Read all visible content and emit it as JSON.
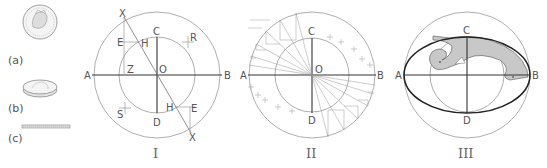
{
  "coins": {
    "a": {
      "label": "(a)",
      "description": "coin face-on"
    },
    "b": {
      "label": "(b)",
      "description": "coin tilted"
    },
    "c": {
      "label": "(c)",
      "description": "coin edge-on"
    }
  },
  "diagram_I": {
    "numeral": "I",
    "labels": {
      "A": "A",
      "B": "B",
      "C": "C",
      "D": "D",
      "O": "O",
      "Z": "Z",
      "E1": "E",
      "E2": "E",
      "H1": "H",
      "H2": "H",
      "R": "R",
      "S": "S",
      "X1": "X",
      "X2": "X"
    }
  },
  "diagram_II": {
    "numeral": "II",
    "labels": {
      "A": "A",
      "B": "B",
      "C": "C",
      "D": "D",
      "O": "O"
    }
  },
  "diagram_III": {
    "numeral": "III",
    "labels": {
      "A": "A",
      "B": "B",
      "C": "C",
      "D": "D"
    }
  },
  "colors": {
    "line": "#333333",
    "thin": "#999999",
    "curve_fill": "#c8c8c8"
  }
}
